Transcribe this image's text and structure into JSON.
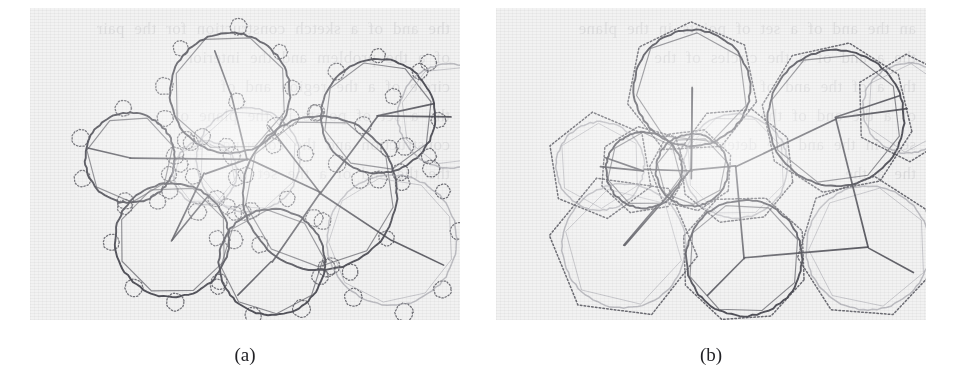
{
  "figure": {
    "type": "scanned-figure",
    "panel_count": 2,
    "background_color": "#f2f2f2",
    "page_color": "#ffffff",
    "ink_dark": "#4a4a52",
    "ink_light": "#9a9aa2",
    "ink_dotted": "#55555d"
  },
  "captions": {
    "a": "(a)",
    "b": "(b)"
  },
  "bleed_text": {
    "a": "the and of a sketch construction for the pair\nof a the problem and the interior\ncircle of a the region and of\nthe a set of points in the plane of\nconstruction and the covering of\nthe the and of a the set of",
    "b": "an the and of a set of points in the plane\nthe a and of a the circles of the\nthe a of the and of\nof a the and of the\nsets in the and the determining\nthe a the"
  },
  "panel_a": {
    "label": "small dotted circles overlay",
    "dotted_overlay_type": "circles",
    "circles": [
      {
        "cx": 200,
        "cy": 85,
        "r": 60,
        "shade": "dark",
        "poly_n": 8,
        "poly_rot": 14
      },
      {
        "cx": 100,
        "cy": 150,
        "r": 45,
        "shade": "dark",
        "poly_n": 7,
        "poly_rot": 30
      },
      {
        "cx": 175,
        "cy": 165,
        "r": 32,
        "shade": "light",
        "poly_n": 7,
        "poly_rot": 8
      },
      {
        "cx": 218,
        "cy": 152,
        "r": 52,
        "shade": "light",
        "poly_n": 8,
        "poly_rot": 20
      },
      {
        "cx": 290,
        "cy": 185,
        "r": 77,
        "shade": "dark",
        "poly_n": 9,
        "poly_rot": 5
      },
      {
        "cx": 348,
        "cy": 108,
        "r": 57,
        "shade": "dark",
        "poly_n": 8,
        "poly_rot": 24
      },
      {
        "cx": 420,
        "cy": 108,
        "r": 52,
        "shade": "light",
        "poly_n": 8,
        "poly_rot": 10
      },
      {
        "cx": 142,
        "cy": 232,
        "r": 57,
        "shade": "dark",
        "poly_n": 8,
        "poly_rot": 16
      },
      {
        "cx": 242,
        "cy": 254,
        "r": 53,
        "shade": "dark",
        "poly_n": 8,
        "poly_rot": 34
      },
      {
        "cx": 362,
        "cy": 232,
        "r": 65,
        "shade": "light",
        "poly_n": 9,
        "poly_rot": 12
      }
    ],
    "small_dotted_radius": 8,
    "edges": [
      [
        200,
        85,
        218,
        152
      ],
      [
        218,
        152,
        100,
        150
      ],
      [
        218,
        152,
        175,
        165
      ],
      [
        218,
        152,
        290,
        185
      ],
      [
        290,
        185,
        348,
        108
      ],
      [
        348,
        108,
        420,
        108
      ],
      [
        290,
        185,
        242,
        254
      ],
      [
        290,
        185,
        362,
        232
      ],
      [
        175,
        165,
        142,
        232
      ]
    ],
    "spokes": [
      [
        200,
        85,
        185,
        42
      ],
      [
        100,
        150,
        58,
        140
      ],
      [
        142,
        232,
        178,
        188
      ],
      [
        242,
        254,
        208,
        288
      ],
      [
        362,
        232,
        414,
        258
      ],
      [
        348,
        108,
        404,
        96
      ],
      [
        290,
        185,
        238,
        118
      ]
    ]
  },
  "panel_b": {
    "label": "dotted circumscribing polygons overlay",
    "dotted_overlay_type": "polygons",
    "circles": [
      {
        "cx": 196,
        "cy": 80,
        "r": 58,
        "shade": "dark",
        "poly_n": 7,
        "poly_rot": 12
      },
      {
        "cx": 104,
        "cy": 158,
        "r": 44,
        "shade": "light",
        "poly_n": 6,
        "poly_rot": 22
      },
      {
        "cx": 148,
        "cy": 162,
        "r": 38,
        "shade": "dark",
        "poly_n": 7,
        "poly_rot": 5
      },
      {
        "cx": 196,
        "cy": 162,
        "r": 36,
        "shade": "dark",
        "poly_n": 7,
        "poly_rot": 30
      },
      {
        "cx": 240,
        "cy": 158,
        "r": 52,
        "shade": "light",
        "poly_n": 8,
        "poly_rot": 16
      },
      {
        "cx": 128,
        "cy": 238,
        "r": 62,
        "shade": "light",
        "poly_n": 6,
        "poly_rot": 8
      },
      {
        "cx": 248,
        "cy": 250,
        "r": 58,
        "shade": "dark",
        "poly_n": 8,
        "poly_rot": 20
      },
      {
        "cx": 340,
        "cy": 110,
        "r": 68,
        "shade": "dark",
        "poly_n": 8,
        "poly_rot": 10
      },
      {
        "cx": 412,
        "cy": 100,
        "r": 45,
        "shade": "light",
        "poly_n": 6,
        "poly_rot": 28
      },
      {
        "cx": 372,
        "cy": 240,
        "r": 62,
        "shade": "light",
        "poly_n": 7,
        "poly_rot": 18
      }
    ],
    "edges": [
      [
        196,
        80,
        196,
        162
      ],
      [
        196,
        162,
        148,
        162
      ],
      [
        148,
        162,
        104,
        158
      ],
      [
        196,
        162,
        240,
        158
      ],
      [
        240,
        158,
        340,
        110
      ],
      [
        340,
        110,
        412,
        100
      ],
      [
        196,
        162,
        128,
        238
      ],
      [
        240,
        158,
        248,
        250
      ],
      [
        248,
        250,
        372,
        240
      ],
      [
        340,
        110,
        372,
        240
      ]
    ],
    "spokes": [
      [
        196,
        80,
        196,
        170
      ],
      [
        148,
        162,
        108,
        150
      ],
      [
        128,
        238,
        162,
        196
      ],
      [
        248,
        250,
        212,
        288
      ],
      [
        372,
        240,
        418,
        264
      ],
      [
        340,
        110,
        404,
        88
      ]
    ]
  }
}
